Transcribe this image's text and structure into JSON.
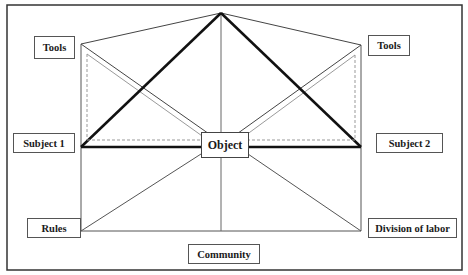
{
  "diagram": {
    "type": "activity-system-network",
    "colors": {
      "frame": "#333333",
      "thin_line": "#444444",
      "thick_line": "#111111",
      "gray_line": "#9a9a9a",
      "node_border": "#555555"
    },
    "nodes": {
      "tools_left": "Tools",
      "tools_right": "Tools",
      "subject_1": "Subject 1",
      "subject_2": "Subject 2",
      "object": "Object",
      "rules": "Rules",
      "division_of_labor": "Division of labor",
      "community": "Community"
    }
  }
}
